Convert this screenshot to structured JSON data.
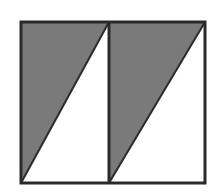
{
  "diagram": {
    "colors": {
      "background": "#ffffff",
      "shade": "#7a7a7a",
      "stroke": "#2a2a2a"
    },
    "outer_rect": {
      "x1": 21,
      "y1": 22,
      "x2": 205,
      "y2": 183
    },
    "divider_x": 109,
    "cells": [
      {
        "name": "left-cell",
        "shaded": "upper-left-triangle"
      },
      {
        "name": "right-cell",
        "shaded": "upper-left-triangle"
      }
    ]
  }
}
